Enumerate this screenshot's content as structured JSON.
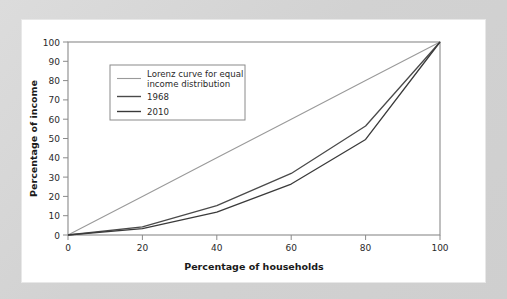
{
  "chart_data": {
    "type": "line",
    "title": "",
    "xlabel": "Percentage of households",
    "ylabel": "Percentage of income",
    "xlim": [
      0,
      100
    ],
    "ylim": [
      0,
      100
    ],
    "xticks": [
      0,
      20,
      40,
      60,
      80,
      100
    ],
    "yticks": [
      0,
      10,
      20,
      30,
      40,
      50,
      60,
      70,
      80,
      90,
      100
    ],
    "grid": false,
    "legend_position": "upper-left",
    "x": [
      0,
      20,
      40,
      60,
      80,
      100
    ],
    "series": [
      {
        "name": "Lorenz curve for equal income distribution",
        "values": [
          0,
          20,
          40,
          60,
          80,
          100
        ],
        "color": "#9a9a9a"
      },
      {
        "name": "1968",
        "values": [
          0,
          4.2,
          15.2,
          31.9,
          56.5,
          100
        ],
        "color": "#4a4a4a"
      },
      {
        "name": "2010",
        "values": [
          0,
          3.3,
          11.8,
          26.4,
          49.5,
          100
        ],
        "color": "#3a3a3a"
      }
    ]
  },
  "axes": {
    "x_title": "Percentage of households",
    "y_title": "Percentage of income",
    "x_tick_labels": [
      "0",
      "20",
      "40",
      "60",
      "80",
      "100"
    ],
    "y_tick_labels": [
      "0",
      "10",
      "20",
      "30",
      "40",
      "50",
      "60",
      "70",
      "80",
      "90",
      "100"
    ]
  },
  "legend": {
    "entries": [
      {
        "label_line1": "Lorenz curve for equal",
        "label_line2": "income distribution"
      },
      {
        "label_line1": "1968",
        "label_line2": ""
      },
      {
        "label_line1": "2010",
        "label_line2": ""
      }
    ]
  },
  "colors": {
    "page_background": "#d4d4d4",
    "card_background": "#ffffff",
    "frame": "#8a8a8a",
    "equal_line": "#9a9a9a",
    "line_1968": "#4a4a4a",
    "line_2010": "#3a3a3a",
    "text": "#2a2a2a"
  }
}
